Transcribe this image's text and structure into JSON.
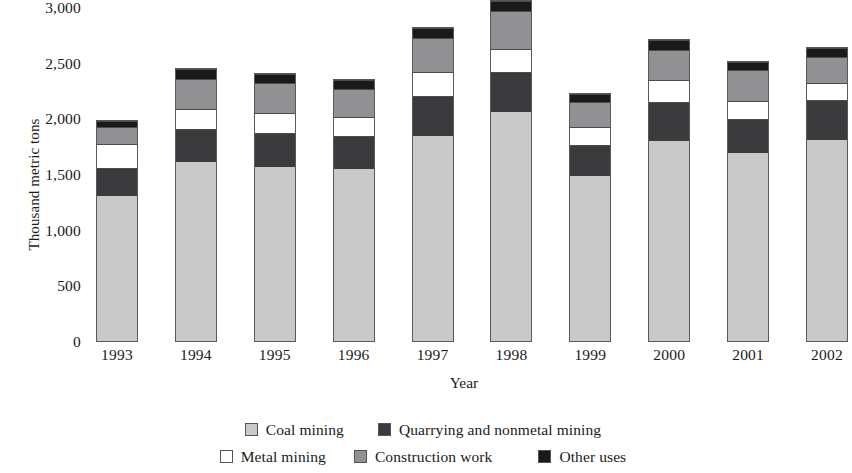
{
  "chart_data": {
    "type": "bar",
    "stacked": true,
    "title": "",
    "xlabel": "Year",
    "ylabel": "Thousand metric tons",
    "categories": [
      "1993",
      "1994",
      "1995",
      "1996",
      "1997",
      "1998",
      "1999",
      "2000",
      "2001",
      "2002"
    ],
    "ytick_labels": [
      "0",
      "500",
      "1,000",
      "1,500",
      "2,000",
      "2,500",
      "3,000"
    ],
    "ytick_values": [
      0,
      500,
      1000,
      1500,
      2000,
      2500,
      3000
    ],
    "ylim": [
      0,
      3000
    ],
    "grid": false,
    "legend_position": "bottom",
    "series": [
      {
        "name": "Coal mining",
        "color": "#c9c9c9",
        "values": [
          1300,
          1610,
          1560,
          1545,
          1845,
          2055,
          1480,
          1800,
          1685,
          1810
        ]
      },
      {
        "name": "Quarrying and nonmetal mining",
        "color": "#3b3b3d",
        "values": [
          255,
          295,
          310,
          300,
          355,
          360,
          280,
          345,
          305,
          355
        ]
      },
      {
        "name": "Metal mining",
        "color": "#ffffff",
        "values": [
          215,
          175,
          175,
          165,
          215,
          205,
          160,
          200,
          170,
          150
        ]
      },
      {
        "name": "Construction work",
        "color": "#919194",
        "values": [
          150,
          270,
          270,
          250,
          305,
          345,
          230,
          270,
          270,
          235
        ]
      },
      {
        "name": "Other uses",
        "color": "#1a1a1a",
        "values": [
          60,
          90,
          85,
          85,
          90,
          90,
          70,
          90,
          75,
          85
        ]
      }
    ],
    "totals": [
      1980,
      2440,
      2400,
      2345,
      2810,
      3055,
      2220,
      2705,
      2505,
      2635
    ]
  }
}
